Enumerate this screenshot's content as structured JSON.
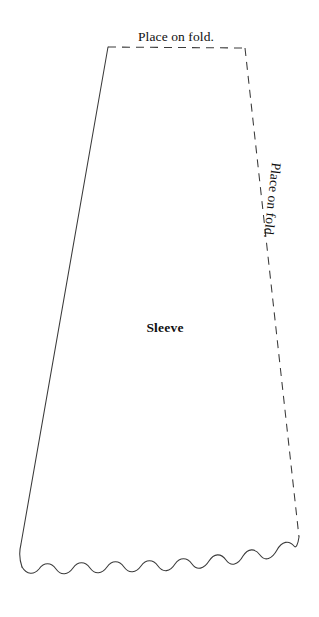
{
  "figure": {
    "name": "sleeve-pattern-piece",
    "background_color": "#ffffff",
    "line_color": "#3a3a3a",
    "text_color": "#101010"
  },
  "labels": {
    "top_fold": "Place on fold.",
    "side_fold": "Place on fold.",
    "piece_name": "Sleeve"
  },
  "geometry": {
    "top_left": [
      108,
      47
    ],
    "top_right": [
      245,
      48
    ],
    "bottom_right": [
      299,
      537
    ],
    "bottom_left": [
      18,
      562
    ],
    "top_edge_style": "dashed",
    "right_edge_style": "dashed",
    "left_edge_style": "solid",
    "bottom_edge_style": "wavy-solid",
    "wave_period": 27,
    "wave_amplitude": 4.5,
    "dash_pattern": "8 6",
    "side_label_rotation_deg": 96
  }
}
